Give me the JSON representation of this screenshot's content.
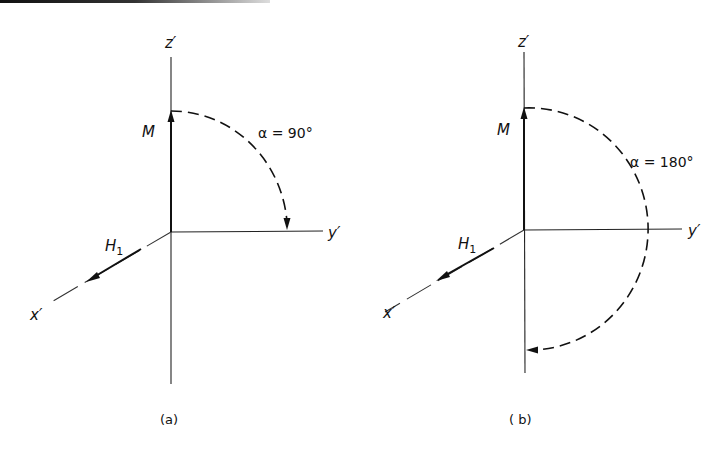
{
  "figure": {
    "panels": [
      {
        "id": "a",
        "caption": "(a)",
        "axis_labels": {
          "z": "z′",
          "y": "y′",
          "x": "x′"
        },
        "vector_label": "M",
        "field_label": "H",
        "field_subscript": "1",
        "angle_label": "α = 90°"
      },
      {
        "id": "b",
        "caption": "( b)",
        "axis_labels": {
          "z": "z′",
          "y": "y′",
          "x": "x′"
        },
        "vector_label": "M",
        "field_label": "H",
        "field_subscript": "1",
        "angle_label": "α = 180°"
      }
    ],
    "colors": {
      "ink": "#111111",
      "background": "#ffffff"
    }
  }
}
